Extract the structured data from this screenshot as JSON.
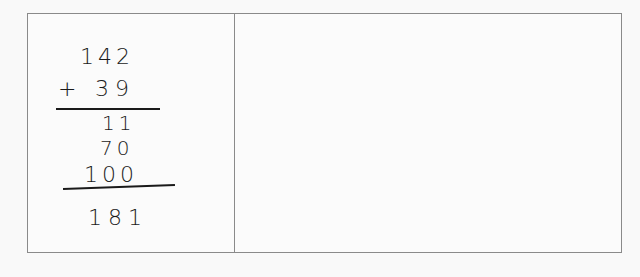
{
  "worksheet": {
    "left_cell": {
      "problem": {
        "addend_1": "142",
        "operator": "+",
        "addend_2": "39",
        "partial_sums": [
          "11",
          "70",
          "100"
        ],
        "total": "181"
      }
    },
    "right_cell": {}
  }
}
